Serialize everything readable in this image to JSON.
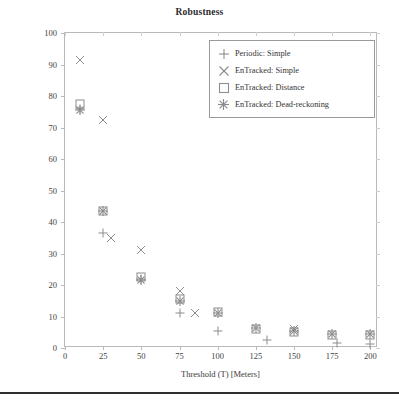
{
  "figure": {
    "title": "Robustness",
    "footer_rule": true
  },
  "chart_data": {
    "type": "scatter",
    "title": "Robustness",
    "xlabel": "Threshold (T) [Meters]",
    "ylabel": "Percentage of Server-side Errors Above Threshold",
    "xlim": [
      0,
      205
    ],
    "ylim": [
      0,
      100
    ],
    "xticks": [
      0,
      25,
      50,
      75,
      100,
      125,
      150,
      175,
      200
    ],
    "yticks": [
      0,
      10,
      20,
      30,
      40,
      50,
      60,
      70,
      80,
      90,
      100
    ],
    "grid": false,
    "legend_position": "upper right",
    "marker_color": "#8c8c8c",
    "x": [
      10,
      25,
      50,
      75,
      100,
      125,
      150,
      175,
      200
    ],
    "series": [
      {
        "name": "Periodic: Simple",
        "marker": "plus",
        "values": [
          76.0,
          36.5,
          22.0,
          11.0,
          5.5,
          2.5,
          1.5,
          1.2,
          1.0
        ]
      },
      {
        "name": "EnTracked: Simple",
        "marker": "x",
        "values": [
          91.5,
          72.5,
          35.0,
          31.0,
          18.0,
          11.0,
          6.0,
          4.5,
          4.0
        ]
      },
      {
        "name": "EnTracked: Distance",
        "marker": "square",
        "values": [
          77.5,
          43.5,
          22.5,
          15.5,
          11.5,
          6.0,
          5.0,
          4.0,
          4.0
        ]
      },
      {
        "name": "EnTracked: Dead-reckoning",
        "marker": "star",
        "values": [
          75.5,
          43.5,
          21.5,
          15.0,
          11.0,
          6.5,
          5.5,
          4.5,
          4.5
        ]
      }
    ],
    "scatter_points": [
      {
        "series": "EnTracked: Simple",
        "marker": "x",
        "x": 10,
        "y": 91.5
      },
      {
        "series": "EnTracked: Distance",
        "marker": "square",
        "x": 10,
        "y": 77.5
      },
      {
        "series": "Periodic: Simple",
        "marker": "plus",
        "x": 10,
        "y": 76.0
      },
      {
        "series": "EnTracked: Dead-reckoning",
        "marker": "star",
        "x": 10,
        "y": 75.5
      },
      {
        "series": "EnTracked: Simple",
        "marker": "x",
        "x": 25,
        "y": 72.5
      },
      {
        "series": "EnTracked: Distance",
        "marker": "square",
        "x": 25,
        "y": 43.5
      },
      {
        "series": "EnTracked: Dead-reckoning",
        "marker": "star",
        "x": 25,
        "y": 43.5
      },
      {
        "series": "Periodic: Simple",
        "marker": "plus",
        "x": 25,
        "y": 36.5
      },
      {
        "series": "EnTracked: Simple",
        "marker": "x",
        "x": 30,
        "y": 35.0
      },
      {
        "series": "EnTracked: Simple",
        "marker": "x",
        "x": 50,
        "y": 31.0
      },
      {
        "series": "EnTracked: Distance",
        "marker": "square",
        "x": 50,
        "y": 22.5
      },
      {
        "series": "Periodic: Simple",
        "marker": "plus",
        "x": 50,
        "y": 22.0
      },
      {
        "series": "EnTracked: Dead-reckoning",
        "marker": "star",
        "x": 50,
        "y": 21.5
      },
      {
        "series": "EnTracked: Simple",
        "marker": "x",
        "x": 75,
        "y": 18.0
      },
      {
        "series": "EnTracked: Distance",
        "marker": "square",
        "x": 75,
        "y": 15.5
      },
      {
        "series": "EnTracked: Dead-reckoning",
        "marker": "star",
        "x": 75,
        "y": 15.0
      },
      {
        "series": "Periodic: Simple",
        "marker": "plus",
        "x": 75,
        "y": 11.0
      },
      {
        "series": "EnTracked: Simple",
        "marker": "x",
        "x": 85,
        "y": 11.0
      },
      {
        "series": "EnTracked: Distance",
        "marker": "square",
        "x": 100,
        "y": 11.5
      },
      {
        "series": "EnTracked: Dead-reckoning",
        "marker": "star",
        "x": 100,
        "y": 11.0
      },
      {
        "series": "Periodic: Simple",
        "marker": "plus",
        "x": 100,
        "y": 5.5
      },
      {
        "series": "EnTracked: Distance",
        "marker": "square",
        "x": 125,
        "y": 6.0
      },
      {
        "series": "EnTracked: Dead-reckoning",
        "marker": "star",
        "x": 125,
        "y": 6.5
      },
      {
        "series": "Periodic: Simple",
        "marker": "plus",
        "x": 132,
        "y": 2.5
      },
      {
        "series": "EnTracked: Distance",
        "marker": "square",
        "x": 150,
        "y": 5.0
      },
      {
        "series": "EnTracked: Dead-reckoning",
        "marker": "star",
        "x": 150,
        "y": 5.5
      },
      {
        "series": "EnTracked: Simple",
        "marker": "x",
        "x": 150,
        "y": 6.0
      },
      {
        "series": "EnTracked: Distance",
        "marker": "square",
        "x": 175,
        "y": 4.0
      },
      {
        "series": "EnTracked: Dead-reckoning",
        "marker": "star",
        "x": 175,
        "y": 4.5
      },
      {
        "series": "Periodic: Simple",
        "marker": "plus",
        "x": 178,
        "y": 1.5
      },
      {
        "series": "EnTracked: Distance",
        "marker": "square",
        "x": 200,
        "y": 4.0
      },
      {
        "series": "EnTracked: Dead-reckoning",
        "marker": "star",
        "x": 200,
        "y": 4.5
      },
      {
        "series": "Periodic: Simple",
        "marker": "plus",
        "x": 200,
        "y": 1.2
      }
    ],
    "legend": [
      {
        "label": "Periodic: Simple",
        "marker": "plus"
      },
      {
        "label": "EnTracked: Simple",
        "marker": "x"
      },
      {
        "label": "EnTracked: Distance",
        "marker": "square"
      },
      {
        "label": "EnTracked: Dead-reckoning",
        "marker": "star"
      }
    ]
  }
}
